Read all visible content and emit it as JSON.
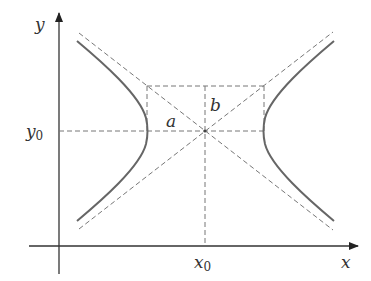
{
  "diagram": {
    "axes": {
      "x_label": "x",
      "y_label": "y",
      "x_tick_label": {
        "main": "x",
        "sub": "0"
      },
      "y_tick_label": {
        "main": "y",
        "sub": "0"
      }
    },
    "labels": {
      "a": "a",
      "b": "b"
    },
    "colors": {
      "curve": "#666666",
      "axis": "#333333",
      "dashed": "#777777"
    }
  }
}
